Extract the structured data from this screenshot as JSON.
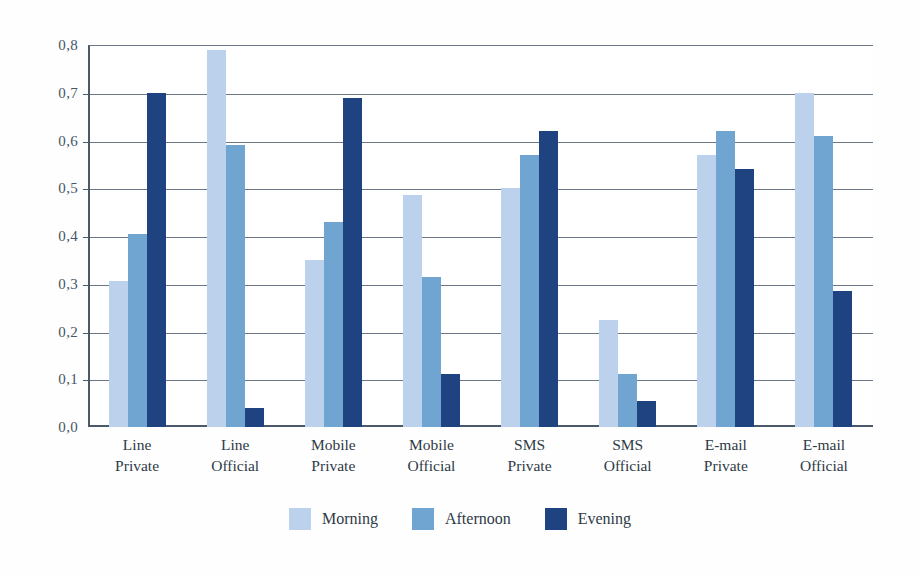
{
  "chart_data": {
    "type": "bar",
    "title": "",
    "subtitle": "",
    "xlabel": "",
    "ylabel": "",
    "ylim": [
      0.0,
      0.8
    ],
    "grid": true,
    "legend_position": "bottom",
    "decimal_separator": ",",
    "categories": [
      "Line Private",
      "Line Official",
      "Mobile Private",
      "Mobile Official",
      "SMS Private",
      "SMS Official",
      "E-mail Private",
      "E-mail Official"
    ],
    "category_lines": [
      {
        "line1": "Line",
        "line2": "Private"
      },
      {
        "line1": "Line",
        "line2": "Official"
      },
      {
        "line1": "Mobile",
        "line2": "Private"
      },
      {
        "line1": "Mobile",
        "line2": "Official"
      },
      {
        "line1": "SMS",
        "line2": "Private"
      },
      {
        "line1": "SMS",
        "line2": "Official"
      },
      {
        "line1": "E-mail",
        "line2": "Private"
      },
      {
        "line1": "E-mail",
        "line2": "Official"
      }
    ],
    "series": [
      {
        "name": "Morning",
        "color": "#bcd2ec",
        "values": [
          0.305,
          0.79,
          0.35,
          0.485,
          0.5,
          0.225,
          0.57,
          0.7
        ]
      },
      {
        "name": "Afternoon",
        "color": "#6fa5d0",
        "values": [
          0.405,
          0.59,
          0.43,
          0.315,
          0.57,
          0.11,
          0.62,
          0.61
        ]
      },
      {
        "name": "Evening",
        "color": "#1f4281",
        "values": [
          0.7,
          0.04,
          0.69,
          0.11,
          0.62,
          0.055,
          0.54,
          0.285
        ]
      }
    ],
    "ytick_labels": [
      "0,8",
      "0,7",
      "0,6",
      "0,5",
      "0,4",
      "0,3",
      "0,2",
      "0,1",
      "0,0"
    ],
    "ytick_values": [
      0.8,
      0.7,
      0.6,
      0.5,
      0.4,
      0.3,
      0.2,
      0.1,
      0.0
    ]
  },
  "legend": {
    "items": [
      {
        "label": "Morning",
        "key": "morning"
      },
      {
        "label": "Afternoon",
        "key": "afternoon"
      },
      {
        "label": "Evening",
        "key": "evening"
      }
    ]
  },
  "colors": {
    "morning": "#bcd2ec",
    "afternoon": "#6fa5d0",
    "evening": "#1f4281",
    "axis": "#4a5a6a",
    "grid": "#6b7785",
    "text": "#2e3a46",
    "background": "#ffffff"
  }
}
